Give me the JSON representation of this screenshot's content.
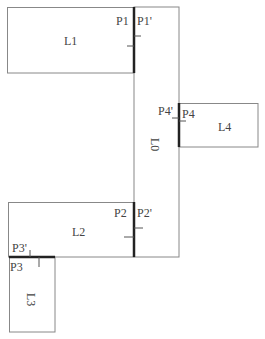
{
  "diagram": {
    "type": "floor-plan-connectivity",
    "rooms": [
      {
        "id": "L0",
        "label": "L0",
        "rotated": true
      },
      {
        "id": "L1",
        "label": "L1"
      },
      {
        "id": "L2",
        "label": "L2"
      },
      {
        "id": "L3",
        "label": "L3",
        "rotated": true
      },
      {
        "id": "L4",
        "label": "L4"
      }
    ],
    "ports": [
      {
        "id": "P1",
        "label": "P1"
      },
      {
        "id": "P1p",
        "label": "P1'"
      },
      {
        "id": "P2",
        "label": "P2"
      },
      {
        "id": "P2p",
        "label": "P2'"
      },
      {
        "id": "P3",
        "label": "P3"
      },
      {
        "id": "P3p",
        "label": "P3'"
      },
      {
        "id": "P4",
        "label": "P4"
      },
      {
        "id": "P4p",
        "label": "P4'"
      }
    ],
    "connections": [
      {
        "from": "L1",
        "to": "L0",
        "via": [
          "P1",
          "P1'"
        ]
      },
      {
        "from": "L2",
        "to": "L0",
        "via": [
          "P2",
          "P2'"
        ]
      },
      {
        "from": "L3",
        "to": "L2",
        "via": [
          "P3",
          "P3'"
        ]
      },
      {
        "from": "L4",
        "to": "L0",
        "via": [
          "P4",
          "P4'"
        ]
      }
    ],
    "colors": {
      "outline": "#888888",
      "port": "#222222",
      "text": "#444444"
    }
  }
}
